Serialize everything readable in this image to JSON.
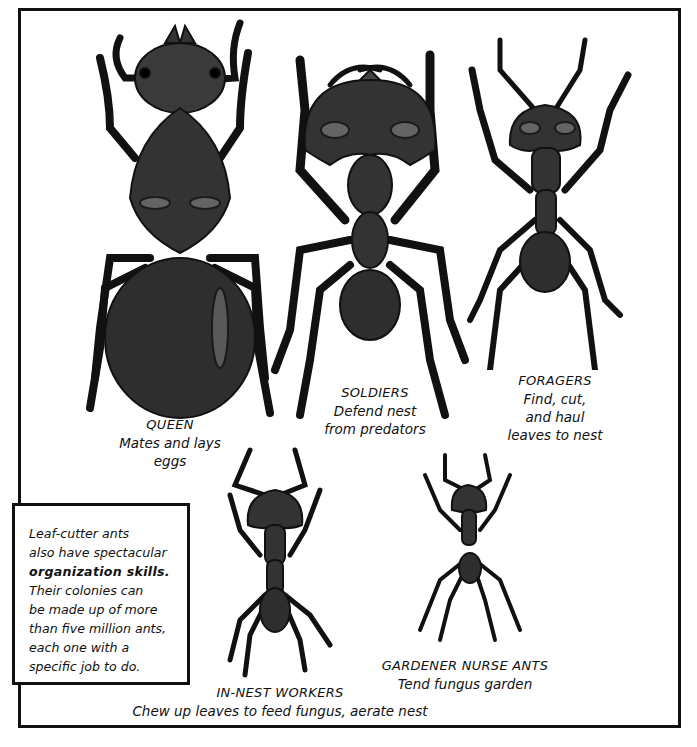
{
  "panel": {
    "castes": [
      {
        "id": "queen",
        "title": "QUEEN",
        "desc": [
          "Mates and lays",
          "eggs"
        ]
      },
      {
        "id": "soldiers",
        "title": "SOLDIERS",
        "desc": [
          "Defend nest",
          "from predators"
        ]
      },
      {
        "id": "foragers",
        "title": "FORAGERS",
        "desc": [
          "Find, cut,",
          "and haul",
          "leaves to nest"
        ]
      },
      {
        "id": "in-nest-workers",
        "title": "IN-NEST WORKERS",
        "desc": [
          "Chew up leaves to feed fungus, aerate nest"
        ]
      },
      {
        "id": "gardener-nurse-ants",
        "title": "GARDENER NURSE ANTS",
        "desc": [
          "Tend fungus garden"
        ]
      }
    ],
    "info_box": {
      "lines": [
        "Leaf-cutter ants",
        "also have spectacular",
        "organization skills.",
        "Their colonies can",
        "be made up of more",
        "than five million ants,",
        "each one with a",
        "specific job to do."
      ],
      "bold_line_index": 2
    },
    "colors": {
      "border": "#111111",
      "ant_body": "#2e2e2e",
      "ant_highlight": "#6a6a6a",
      "background": "#ffffff"
    }
  }
}
